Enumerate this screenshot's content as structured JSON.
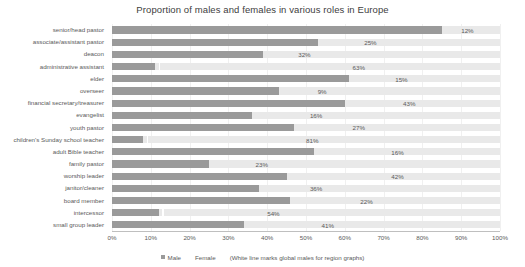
{
  "chart_data": {
    "type": "bar",
    "title": "Proportion of males and females in various roles in Europe",
    "xlabel": "",
    "ylabel": "",
    "xlim": [
      0,
      100
    ],
    "grid": true,
    "stacked": true,
    "orientation": "horizontal",
    "legend_position": "bottom",
    "xticks": [
      "0%",
      "10%",
      "20%",
      "30%",
      "40%",
      "50%",
      "60%",
      "70%",
      "80%",
      "90%",
      "100%"
    ],
    "xtick_values": [
      0,
      10,
      20,
      30,
      40,
      50,
      60,
      70,
      80,
      90,
      100
    ],
    "categories": [
      "senior/head pastor",
      "associate/assistant pastor",
      "deacon",
      "administrative assistant",
      "elder",
      "overseer",
      "financial secretary/treasurer",
      "evangelist",
      "youth pastor",
      "children's Sunday school teacher",
      "adult Bible teacher",
      "family pastor",
      "worship leader",
      "janitor/cleaner",
      "board member",
      "intercessor",
      "small group leader"
    ],
    "series": [
      {
        "name": "Male",
        "color": "#9a9a9a",
        "values": [
          85,
          53,
          39,
          11,
          61,
          43,
          60,
          36,
          47,
          8,
          52,
          25,
          45,
          38,
          46,
          12,
          34
        ]
      },
      {
        "name": "Female",
        "color": "#e9e9e9",
        "values": [
          15,
          47,
          61,
          89,
          39,
          57,
          40,
          64,
          53,
          92,
          48,
          75,
          55,
          62,
          54,
          88,
          66
        ]
      }
    ],
    "data_labels": [
      "12%",
      "25%",
      "32%",
      "63%",
      "15%",
      "9%",
      "43%",
      "16%",
      "27%",
      "81%",
      "16%",
      "23%",
      "42%",
      "36%",
      "22%",
      "54%",
      "41%"
    ],
    "data_label_positions": [
      90,
      65,
      48,
      62,
      73,
      53,
      75,
      51,
      62,
      50,
      72,
      37,
      72,
      51,
      64,
      40,
      54
    ],
    "global_male_marks": [
      null,
      null,
      null,
      12,
      null,
      null,
      null,
      null,
      null,
      9,
      null,
      null,
      null,
      null,
      null,
      13,
      null
    ],
    "annotation": "(White line marks global males for region graphs)"
  },
  "legend": {
    "male_label": "Male",
    "female_label": "Female",
    "note": "(White line marks global males for region graphs)"
  }
}
